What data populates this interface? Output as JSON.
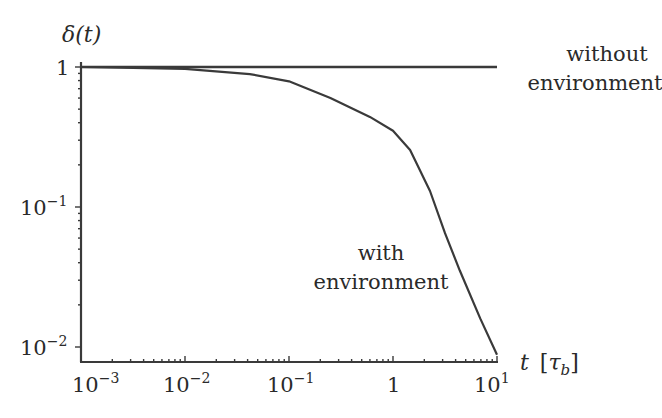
{
  "chart_data": {
    "type": "line",
    "title": "",
    "xlabel": "t [τb]",
    "ylabel": "δ(t)",
    "xscale": "log",
    "yscale": "log",
    "xlim": [
      0.001,
      10
    ],
    "ylim": [
      0.01,
      1
    ],
    "x_ticks": [
      0.001,
      0.01,
      0.1,
      1,
      10
    ],
    "x_tick_labels": [
      "10^-3",
      "10^-2",
      "10^-1",
      "1",
      "10^1"
    ],
    "y_ticks": [
      0.01,
      0.1,
      1
    ],
    "y_tick_labels": [
      "10^-2",
      "10^-1",
      "1"
    ],
    "grid": false,
    "legend": "none (inline annotations)",
    "series": [
      {
        "name": "without environment",
        "x": [
          0.001,
          0.01,
          0.1,
          1,
          10
        ],
        "y": [
          1,
          1,
          1,
          1,
          1
        ]
      },
      {
        "name": "with environment",
        "x": [
          0.001,
          0.01,
          0.042,
          0.1,
          0.25,
          0.6,
          1,
          1.46,
          2.27,
          3.16,
          4.4,
          6.9,
          10
        ],
        "y": [
          1.0,
          0.97,
          0.89,
          0.79,
          0.6,
          0.44,
          0.35,
          0.255,
          0.13,
          0.065,
          0.035,
          0.016,
          0.0088
        ]
      }
    ],
    "annotations": [
      {
        "text": "without environment",
        "position": "right of horizontal line at δ=1"
      },
      {
        "text": "with environment",
        "position": "left of decaying curve near t≈1–3"
      }
    ]
  },
  "labels": {
    "ylabel_main": "δ(t)",
    "xlabel_main": "t",
    "xlabel_unit_open": "[",
    "xlabel_unit_tau": "τ",
    "xlabel_unit_sub": "b",
    "xlabel_unit_close": "]",
    "without_line1": "without",
    "without_line2": "environment",
    "with_line1": "with",
    "with_line2": "environment",
    "xtick_base": "10",
    "xtick_exp": [
      "−3",
      "−2",
      "−1",
      "",
      "1"
    ],
    "xtick_one": "1",
    "ytick_base": "10",
    "ytick_exp": [
      "−1",
      "−2"
    ],
    "ytick_one": "1"
  },
  "colors": {
    "line": "#3a3a3a",
    "axis": "#3a3a3a",
    "text": "#2a2a2a"
  }
}
